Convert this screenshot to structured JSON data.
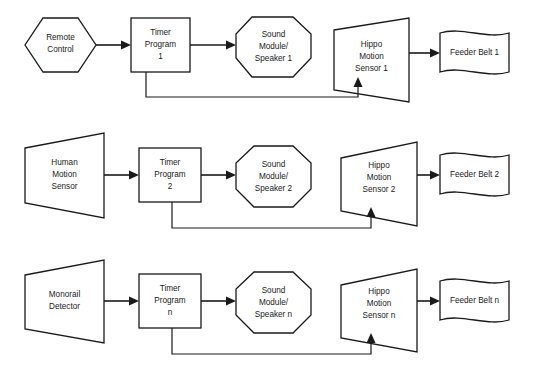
{
  "diagram": {
    "background_color": "#ffffff",
    "line_color": "#1a1a1a",
    "rows": [
      {
        "id": "row-1",
        "input": {
          "label_lines": [
            "Remote",
            "Control"
          ],
          "shape": "hexagon"
        },
        "timer": {
          "label_lines": [
            "Timer",
            "Program",
            "1"
          ],
          "shape": "rectangle"
        },
        "sound": {
          "label_lines": [
            "Sound",
            "Module/",
            "Speaker 1"
          ],
          "shape": "octagon"
        },
        "sensor": {
          "label_lines": [
            "Hippo",
            "Motion",
            "Sensor 1"
          ],
          "shape": "trapezoid-right"
        },
        "output": {
          "label_lines": [
            "Feeder Belt 1"
          ],
          "shape": "wave"
        }
      },
      {
        "id": "row-2",
        "input": {
          "label_lines": [
            "Human",
            "Motion",
            "Sensor"
          ],
          "shape": "trapezoid-right"
        },
        "timer": {
          "label_lines": [
            "Timer",
            "Program",
            "2"
          ],
          "shape": "rectangle"
        },
        "sound": {
          "label_lines": [
            "Sound",
            "Module/",
            "Speaker 2"
          ],
          "shape": "octagon"
        },
        "sensor": {
          "label_lines": [
            "Hippo",
            "Motion",
            "Sensor 2"
          ],
          "shape": "trapezoid-right"
        },
        "output": {
          "label_lines": [
            "Feeder Belt 2"
          ],
          "shape": "wave"
        }
      },
      {
        "id": "row-3",
        "input": {
          "label_lines": [
            "Monorail",
            "Detector"
          ],
          "shape": "trapezoid-right"
        },
        "timer": {
          "label_lines": [
            "Timer",
            "Program",
            "n"
          ],
          "shape": "rectangle"
        },
        "sound": {
          "label_lines": [
            "Sound",
            "Module/",
            "Speaker n"
          ],
          "shape": "octagon"
        },
        "sensor": {
          "label_lines": [
            "Hippo",
            "Motion",
            "Sensor n"
          ],
          "shape": "trapezoid-right"
        },
        "output": {
          "label_lines": [
            "Feeder Belt n"
          ],
          "shape": "wave"
        }
      }
    ]
  },
  "r1": {
    "input_l1": "Remote",
    "input_l2": "Control",
    "input_l3": "",
    "timer_l1": "Timer",
    "timer_l2": "Program",
    "timer_l3": "1",
    "sound_l1": "Sound",
    "sound_l2": "Module/",
    "sound_l3": "Speaker 1",
    "sensor_l1": "Hippo",
    "sensor_l2": "Motion",
    "sensor_l3": "Sensor 1",
    "output_l1": "Feeder Belt 1"
  },
  "r2": {
    "input_l1": "Human",
    "input_l2": "Motion",
    "input_l3": "Sensor",
    "timer_l1": "Timer",
    "timer_l2": "Program",
    "timer_l3": "2",
    "sound_l1": "Sound",
    "sound_l2": "Module/",
    "sound_l3": "Speaker 2",
    "sensor_l1": "Hippo",
    "sensor_l2": "Motion",
    "sensor_l3": "Sensor 2",
    "output_l1": "Feeder Belt 2"
  },
  "r3": {
    "input_l1": "Monorail",
    "input_l2": "Detector",
    "input_l3": "",
    "timer_l1": "Timer",
    "timer_l2": "Program",
    "timer_l3": "n",
    "sound_l1": "Sound",
    "sound_l2": "Module/",
    "sound_l3": "Speaker n",
    "sensor_l1": "Hippo",
    "sensor_l2": "Motion",
    "sensor_l3": "Sensor n",
    "output_l1": "Feeder Belt n"
  }
}
